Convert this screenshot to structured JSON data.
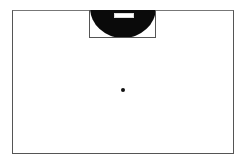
{
  "diagram": {
    "type": "field-layout",
    "outer_boundary": {
      "x": 12,
      "y": 10,
      "width": 222,
      "height": 144,
      "stroke": "#555555"
    },
    "goal_box": {
      "x": 89,
      "y": 10,
      "width": 67,
      "height": 28,
      "stroke": "#555555"
    },
    "semicircle": {
      "fill": "#0a0a0a"
    },
    "goal_slot": {
      "x": 114,
      "y": 13,
      "width": 20,
      "height": 5,
      "fill": "#ffffff"
    },
    "center_point": {
      "x": 123,
      "y": 90,
      "fill": "#111111"
    }
  }
}
